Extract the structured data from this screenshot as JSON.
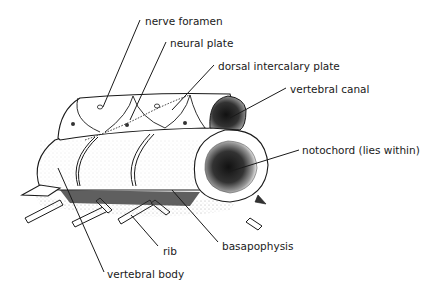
{
  "diagram": {
    "labels": [
      {
        "id": "nerve-foramen",
        "text": "nerve foramen",
        "x": 145,
        "y": 16
      },
      {
        "id": "neural-plate",
        "text": "neural plate",
        "x": 170,
        "y": 38
      },
      {
        "id": "dorsal-intercalary-plate",
        "text": "dorsal intercalary plate",
        "x": 218,
        "y": 61
      },
      {
        "id": "vertebral-canal",
        "text": "vertebral canal",
        "x": 290,
        "y": 84
      },
      {
        "id": "notochord",
        "text": "notochord (lies within)",
        "x": 302,
        "y": 145
      },
      {
        "id": "rib",
        "text": "rib",
        "x": 163,
        "y": 246
      },
      {
        "id": "basapophysis",
        "text": "basapophysis",
        "x": 222,
        "y": 241
      },
      {
        "id": "vertebral-body",
        "text": "vertebral body",
        "x": 107,
        "y": 269
      }
    ],
    "ink_color": "#1a1a1a",
    "shade_color": "#2a2a2a"
  }
}
